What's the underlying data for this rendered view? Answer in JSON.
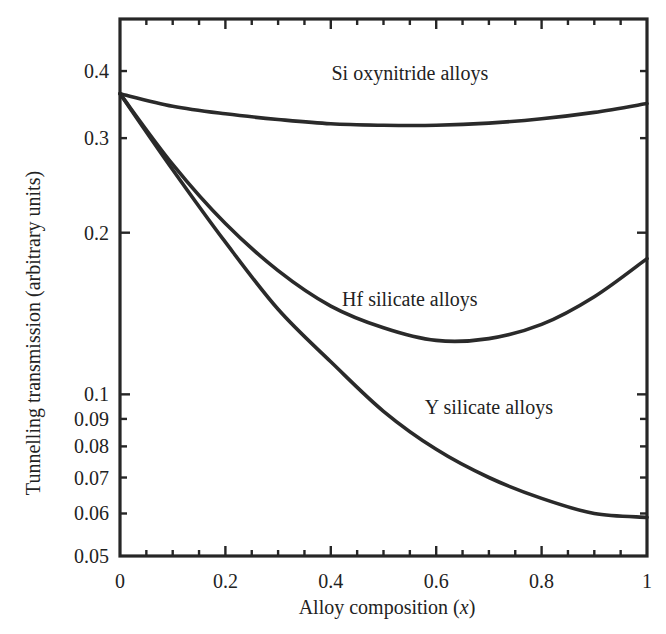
{
  "chart_data": {
    "type": "line",
    "title": "",
    "xlabel": "Alloy composition (x)",
    "xlabel_main": "Alloy composition ",
    "xlabel_var": "x",
    "ylabel": "Tunnelling transmission (arbitrary units)",
    "xscale": "linear",
    "yscale": "log",
    "xlim": [
      0,
      1
    ],
    "ylim": [
      0.05,
      0.5
    ],
    "grid": false,
    "legend": "inline labels",
    "x_ticks": [
      {
        "value": 0,
        "label": "0"
      },
      {
        "value": 0.2,
        "label": "0.2"
      },
      {
        "value": 0.4,
        "label": "0.4"
      },
      {
        "value": 0.6,
        "label": "0.6"
      },
      {
        "value": 0.8,
        "label": "0.8"
      },
      {
        "value": 1,
        "label": "1"
      }
    ],
    "x_minor_step": 0.05,
    "y_ticks": [
      {
        "value": 0.4,
        "label": "0.4"
      },
      {
        "value": 0.3,
        "label": "0.3"
      },
      {
        "value": 0.2,
        "label": "0.2"
      },
      {
        "value": 0.1,
        "label": "0.1"
      },
      {
        "value": 0.09,
        "label": "0.09"
      },
      {
        "value": 0.08,
        "label": "0.08"
      },
      {
        "value": 0.07,
        "label": "0.07"
      },
      {
        "value": 0.06,
        "label": "0.06"
      },
      {
        "value": 0.05,
        "label": "0.05"
      }
    ],
    "x": [
      0,
      0.1,
      0.2,
      0.3,
      0.4,
      0.5,
      0.6,
      0.7,
      0.8,
      0.9,
      1.0
    ],
    "series": [
      {
        "name": "Si oxynitride alloys",
        "label_pos": {
          "x": 0.55,
          "y": 0.385
        },
        "values": [
          0.363,
          0.344,
          0.333,
          0.325,
          0.319,
          0.317,
          0.317,
          0.32,
          0.326,
          0.335,
          0.348
        ]
      },
      {
        "name": "Hf silicate alloys",
        "label_pos": {
          "x": 0.55,
          "y": 0.146
        },
        "values": [
          0.363,
          0.268,
          0.208,
          0.17,
          0.146,
          0.133,
          0.126,
          0.127,
          0.135,
          0.152,
          0.179
        ]
      },
      {
        "name": "Y silicate alloys",
        "label_pos": {
          "x": 0.7,
          "y": 0.092
        },
        "values": [
          0.363,
          0.262,
          0.192,
          0.144,
          0.115,
          0.093,
          0.079,
          0.07,
          0.064,
          0.06,
          0.059
        ]
      }
    ]
  }
}
